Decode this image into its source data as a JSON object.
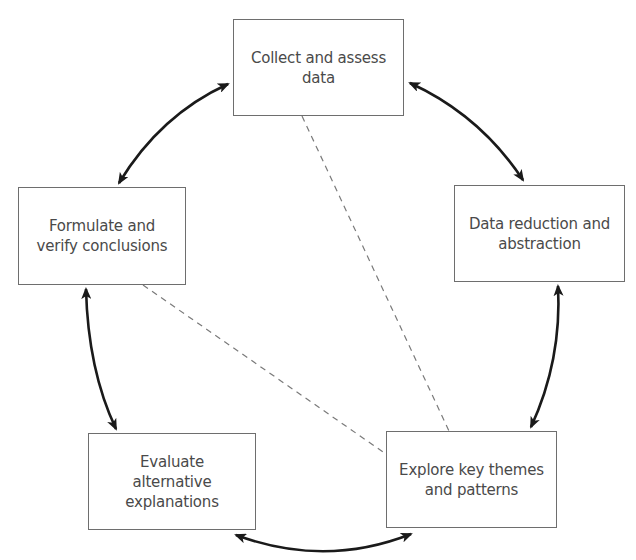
{
  "diagram": {
    "type": "cycle",
    "colors": {
      "box_border": "#6e6e6e",
      "text": "#4a4a4a",
      "arrow": "#1a1a1a",
      "dashed_line": "#7a7a7a",
      "background": "#ffffff"
    },
    "nodes": [
      {
        "id": "collect",
        "label": "Collect and assess data",
        "lines": [
          "Collect and assess",
          "data"
        ],
        "x": 233,
        "y": 19,
        "w": 171,
        "h": 97
      },
      {
        "id": "reduce",
        "label": "Data reduction and abstraction",
        "lines": [
          "Data reduction and",
          "abstraction"
        ],
        "x": 454,
        "y": 185,
        "w": 171,
        "h": 97
      },
      {
        "id": "explore",
        "label": "Explore key themes and patterns",
        "lines": [
          "Explore key themes",
          "and patterns"
        ],
        "x": 386,
        "y": 431,
        "w": 171,
        "h": 97
      },
      {
        "id": "evaluate",
        "label": "Evaluate alternative explanations",
        "lines": [
          "Evaluate",
          "alternative",
          "explanations"
        ],
        "x": 88,
        "y": 433,
        "w": 168,
        "h": 97
      },
      {
        "id": "formulate",
        "label": "Formulate and verify conclusions",
        "lines": [
          "Formulate and",
          "verify conclusions"
        ],
        "x": 18,
        "y": 187,
        "w": 168,
        "h": 98
      }
    ],
    "arrows": [
      {
        "id": "collect-reduce",
        "from": "collect",
        "to": "reduce",
        "bidirectional": true,
        "path": "M 410 83 Q 480 115 523 180"
      },
      {
        "id": "reduce-explore",
        "from": "reduce",
        "to": "explore",
        "bidirectional": true,
        "path": "M 558 286 Q 562 360 531 427"
      },
      {
        "id": "explore-evaluate",
        "from": "explore",
        "to": "evaluate",
        "bidirectional": true,
        "path": "M 411 534 Q 325 568 236 535"
      },
      {
        "id": "evaluate-formulate",
        "from": "evaluate",
        "to": "formulate",
        "bidirectional": true,
        "path": "M 86 289 Q 88 370 116 429"
      },
      {
        "id": "formulate-collect",
        "from": "formulate",
        "to": "collect",
        "bidirectional": true,
        "path": "M 119 183 Q 160 115 228 84"
      }
    ],
    "dashed_links": [
      {
        "id": "collect-explore",
        "from": "collect",
        "to": "explore",
        "x1": 302,
        "y1": 116,
        "x2": 449,
        "y2": 431
      },
      {
        "id": "formulate-explore",
        "from": "formulate",
        "to": "explore",
        "x1": 143,
        "y1": 285,
        "x2": 386,
        "y2": 454
      }
    ]
  }
}
